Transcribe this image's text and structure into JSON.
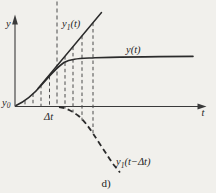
{
  "figure": {
    "caption": "d)",
    "background": "#f1f0ec",
    "ink": "#2b2b2b"
  },
  "axes": {
    "y_label": "y",
    "t_label": "t",
    "origin_label": {
      "base": "y",
      "sub": "0"
    }
  },
  "annotations": {
    "step_label": "Δt"
  },
  "labels": {
    "tangent": {
      "base": "y",
      "sub": "1",
      "args": "(t)"
    },
    "solution": "y(t)",
    "shifted": {
      "base": "y",
      "sub": "1",
      "args": "(t−Δt)"
    }
  },
  "curves": {
    "solution_path": "M16,105.5 C25,101.5 33,95 42,84.5 C51,74 58,66.5 64,62.5 C71,58.5 80,58.6 95,57.7 C115,57 160,56.6 193,56.4",
    "tangent_path": "M38,88.5 L101.5,12.5",
    "shifted_path": "M59,107 C66,108 72,111 78,115.5 C84,120.5 88,126 93,133.5 C99,142.5 106,153.5 113,164 L120,172.5",
    "step_line_path": "M57,1.5 V106.5",
    "upper_guides_path": "M25,100.8 V106.5 M33,93.5 V106.5 M41,84.8 V106.5 M49.5,76 V106.5",
    "lower_guides_path": "M65,56.2 V108.5 M73,46.6 V112.5 M82,35.8 V120.5 M93,22.7 V134"
  }
}
